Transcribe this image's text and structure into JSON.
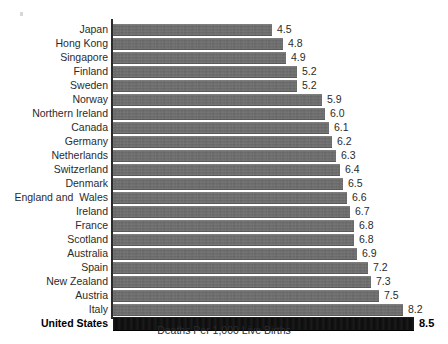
{
  "chart_data": {
    "type": "bar",
    "orientation": "horizontal",
    "title": "",
    "subtitle": "",
    "xlabel": "Deaths Per 1,000 Live Births",
    "ylabel": "",
    "xlim": [
      0,
      8.5
    ],
    "grid": false,
    "legend": null,
    "value_label_format": "one-decimal",
    "categories": [
      "Japan",
      "Hong Kong",
      "Singapore",
      "Finland",
      "Sweden",
      "Norway",
      "Northern Ireland",
      "Canada",
      "Germany",
      "Netherlands",
      "Switzerland",
      "Denmark",
      "England and  Wales",
      "Ireland",
      "France",
      "Scotland",
      "Australia",
      "Spain",
      "New Zealand",
      "Austria",
      "Italy",
      "United States"
    ],
    "values": [
      4.5,
      4.8,
      4.9,
      5.2,
      5.2,
      5.9,
      6.0,
      6.1,
      6.2,
      6.3,
      6.4,
      6.5,
      6.6,
      6.7,
      6.8,
      6.8,
      6.9,
      7.2,
      7.3,
      7.5,
      8.2,
      8.5
    ],
    "value_labels": [
      "4.5",
      "4.8",
      "4.9",
      "5.2",
      "5.2",
      "5.9",
      "6.0",
      "6.1",
      "6.2",
      "6.3",
      "6.4",
      "6.5",
      "6.6",
      "6.7",
      "6.8",
      "6.8",
      "6.9",
      "7.2",
      "7.3",
      "7.5",
      "8.2",
      "8.5"
    ],
    "highlight_index": 21,
    "highlight_category": "United States",
    "colors": {
      "bar": "#6c6c6c",
      "bar_highlight": "#0c0c0c",
      "text": "#2b2b2b",
      "axis": "#2a2a2a",
      "background": "#ffffff"
    }
  }
}
